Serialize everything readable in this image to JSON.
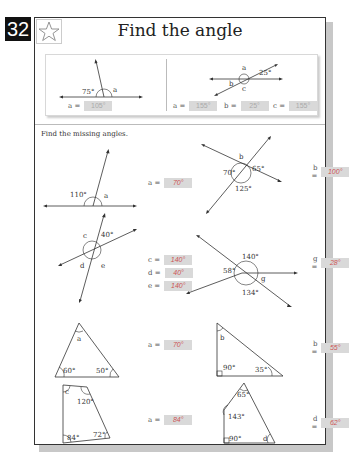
{
  "page_number": "32",
  "title": "Find the angle",
  "star_icon": "star-icon",
  "examples": [
    {
      "labels": {
        "given": "75°",
        "unknown": "a"
      },
      "answers": [
        {
          "label": "a =",
          "value": "105°"
        }
      ]
    },
    {
      "labels": {
        "given": "25°",
        "a": "a",
        "b": "b",
        "c": "c"
      },
      "answers": [
        {
          "label": "a =",
          "value": "155°"
        },
        {
          "label": "b =",
          "value": "25°"
        },
        {
          "label": "c =",
          "value": "155°"
        }
      ]
    }
  ],
  "instructions": "Find the missing angles.",
  "problems": [
    {
      "labels": {
        "given": "110°",
        "unknown": "a"
      },
      "answers": [
        {
          "label": "a =",
          "value": "70°"
        }
      ]
    },
    {
      "labels": {
        "g1": "65°",
        "g2": "70°",
        "g3": "125°",
        "unknown": "b"
      },
      "answers": [
        {
          "label": "b =",
          "value": "100°"
        }
      ]
    },
    {
      "labels": {
        "given": "40°",
        "c": "c",
        "d": "d",
        "e": "e"
      },
      "answers": [
        {
          "label": "c =",
          "value": "140°"
        },
        {
          "label": "d =",
          "value": "40°"
        },
        {
          "label": "e =",
          "value": "140°"
        }
      ]
    },
    {
      "labels": {
        "g1": "140°",
        "g2": "58°",
        "g3": "134°",
        "unknown": "g"
      },
      "answers": [
        {
          "label": "g =",
          "value": "28°"
        }
      ]
    },
    {
      "labels": {
        "g1": "60°",
        "g2": "50°",
        "unknown": "a"
      },
      "answers": [
        {
          "label": "a =",
          "value": "70°"
        }
      ]
    },
    {
      "labels": {
        "g1": "90°",
        "g2": "35°",
        "unknown": "b"
      },
      "answers": [
        {
          "label": "b =",
          "value": "55°"
        }
      ]
    },
    {
      "labels": {
        "g1": "120°",
        "g2": "84°",
        "g3": "72°",
        "unknown": "c"
      },
      "answers": [
        {
          "label": "a =",
          "value": "84°"
        }
      ]
    },
    {
      "labels": {
        "g1": "65°",
        "g2": "143°",
        "g3": "90°",
        "unknown": "d"
      },
      "answers": [
        {
          "label": "d =",
          "value": "62°"
        }
      ]
    }
  ]
}
